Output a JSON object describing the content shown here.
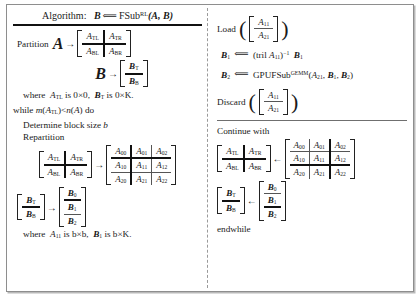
{
  "figure": {
    "title_prefix": "Algorithm:",
    "title_target": "B",
    "title_assign": "⟸",
    "title_fn": "FSub",
    "title_sup": "RL",
    "title_args": "(A,  B)"
  },
  "left": {
    "partition_label": "Partition",
    "partition_A_sym": "A",
    "arrow": "→",
    "A_quad": {
      "TL": "A",
      "TL_sub": "TL",
      "TR": "A",
      "TR_sub": "TR",
      "BL": "A",
      "BL_sub": "BL",
      "BR": "A",
      "BR_sub": "BR"
    },
    "partition_B_sym": "B",
    "B_halves": {
      "T": "B",
      "T_sub": "T",
      "B": "B",
      "B_sub": "B"
    },
    "where1": "where  A_TL is 0×0,   B_T is 0×K.",
    "where1_parts": {
      "where": "where",
      "a": "A",
      "a_sub": "TL",
      "a_is": "is 0×0,",
      "b": "B",
      "b_sub": "T",
      "b_is": "is 0×K."
    },
    "while_line": {
      "kw": "while",
      "m": "m",
      "lp": "(",
      "A": "A",
      "A_sub": "TL",
      "rp": ")",
      "lt": "<",
      "n": "n",
      "nlp": "(",
      "nA": "A",
      "nrp": ")",
      "do": "do"
    },
    "determine": {
      "text": "Determine block size",
      "var": "b"
    },
    "repartition_label": "Repartition",
    "A_rep": {
      "rows": [
        [
          "A00",
          "A01",
          "A02"
        ],
        [
          "A10",
          "A11",
          "A12"
        ],
        [
          "A20",
          "A21",
          "A22"
        ]
      ],
      "subs": [
        [
          "00",
          "01",
          "02"
        ],
        [
          "10",
          "11",
          "12"
        ],
        [
          "20",
          "21",
          "22"
        ]
      ],
      "base": "A",
      "thick_col_after": 1,
      "thick_row_after": 1
    },
    "B_rep": {
      "base": "B",
      "subs": [
        "0",
        "1",
        "2"
      ],
      "thick_row_after": 1
    },
    "where2_parts": {
      "where": "where",
      "a": "A",
      "a_sub": "11",
      "a_is": "is b×b,",
      "b": "B",
      "b_sub": "1",
      "b_is": "is b×K."
    }
  },
  "right": {
    "load_label": "Load",
    "load_stack": {
      "base": "A",
      "top_sub": "11",
      "bot_sub": "21"
    },
    "op1": {
      "lhs": "B",
      "lhs_sub": "1",
      "assign": "⟸",
      "rhs_open": "(tril",
      "rhs_A": "A",
      "rhs_A_sub": "11",
      "rhs_close": ")",
      "rhs_exp": "−1",
      "rhs_B": "B",
      "rhs_B_sub": "1"
    },
    "op2": {
      "lhs": "B",
      "lhs_sub": "2",
      "assign": "⟸",
      "fn": "GPUFSub",
      "fn_sup": "GEMM",
      "a1": "A",
      "a1_sub": "21",
      "a2": "B",
      "a2_sub": "1",
      "a3": "B",
      "a3_sub": "2"
    },
    "discard_label": "Discard",
    "discard_stack": {
      "base": "A",
      "top_sub": "11",
      "bot_sub": "21"
    },
    "continue_label": "Continue with",
    "A_quad": {
      "TL": "A",
      "TL_sub": "TL",
      "TR": "A",
      "TR_sub": "TR",
      "BL": "A",
      "BL_sub": "BL",
      "BR": "A",
      "BR_sub": "BR"
    },
    "arrow_left": "←",
    "A_cont": {
      "base": "A",
      "subs": [
        [
          "00",
          "01",
          "02"
        ],
        [
          "10",
          "11",
          "12"
        ],
        [
          "20",
          "21",
          "22"
        ]
      ],
      "thick_col_after": 2,
      "thick_row_after": 2
    },
    "B_halves": {
      "T": "B",
      "T_sub": "T",
      "B": "B",
      "B_sub": "B"
    },
    "B_cont": {
      "base": "B",
      "subs": [
        "0",
        "1",
        "2"
      ],
      "thick_row_after": 2
    },
    "endwhile": "endwhile"
  }
}
